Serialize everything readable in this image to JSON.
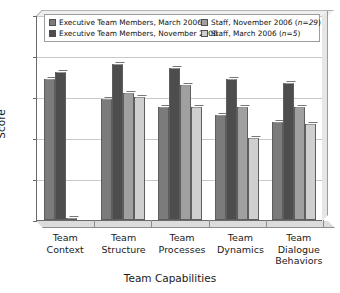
{
  "chart_data": {
    "type": "bar",
    "title": "",
    "xlabel": "Team Capabilities",
    "ylabel": "Score",
    "ylim": [
      1,
      6
    ],
    "yticks": [
      1,
      2,
      3,
      4,
      5,
      6
    ],
    "grid": true,
    "legend_position": "top",
    "categories": [
      "Team Context",
      "Team Structure",
      "Team Processes",
      "Team Dynamics",
      "Team Dialogue Behaviors"
    ],
    "series": [
      {
        "name": "Executive Team Members, March 2006",
        "color": "#7b7b7b",
        "values": [
          4.45,
          3.95,
          3.75,
          3.55,
          3.4
        ]
      },
      {
        "name": "Executive Team Members, November 2006",
        "color": "#4d4d4d",
        "values": [
          4.6,
          4.8,
          4.7,
          4.45,
          4.35
        ]
      },
      {
        "name": "Staff, November 2006 (n=29)",
        "color": "#a0a0a0",
        "values": [
          1.05,
          4.1,
          4.3,
          3.75,
          3.75
        ]
      },
      {
        "name": "Staff, March 2006 (n=5)",
        "color": "#cfcfcf",
        "values": [
          null,
          4.0,
          3.75,
          3.0,
          3.35
        ]
      }
    ]
  },
  "legend": {
    "entries": [
      {
        "label": "Executive Team Members, March 2006",
        "color": "#7b7b7b"
      },
      {
        "label": "Staff, November 2006 (n=29)",
        "color": "#a0a0a0"
      },
      {
        "label": "Executive Team Members, November 2006",
        "color": "#4d4d4d"
      },
      {
        "label": "Staff, March 2006 (n=5)",
        "color": "#cfcfcf"
      }
    ]
  }
}
